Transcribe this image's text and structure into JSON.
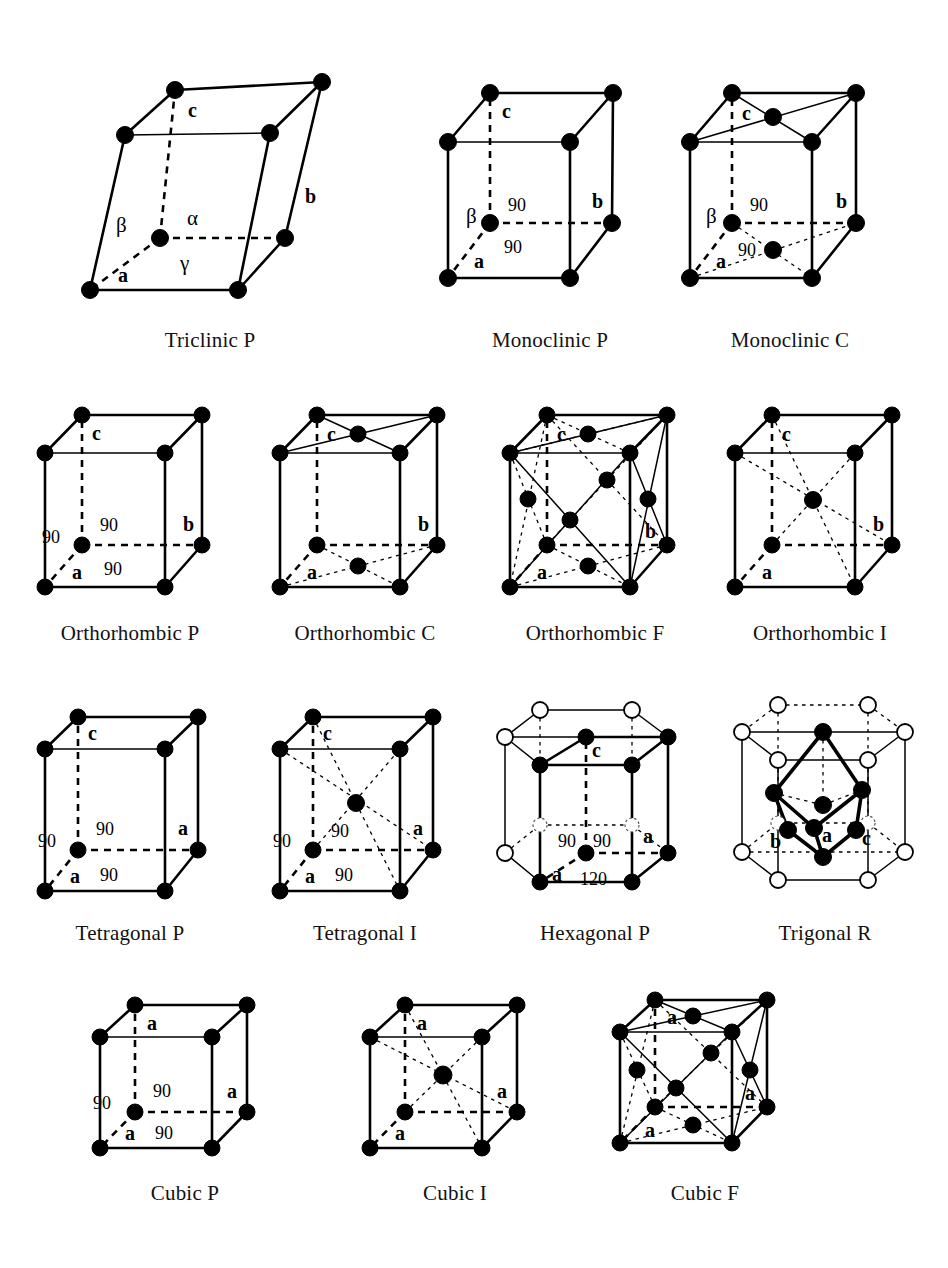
{
  "figure": {
    "background_color": "#ffffff",
    "ink_color": "#000000",
    "node_filled_color": "#000000",
    "node_open_color": "#ffffff"
  },
  "rows": [
    {
      "index": 0,
      "cells": [
        "triclinic_p",
        "monoclinic_p",
        "monoclinic_c"
      ]
    },
    {
      "index": 1,
      "cells": [
        "orthorhombic_p",
        "orthorhombic_c",
        "orthorhombic_f",
        "orthorhombic_i"
      ]
    },
    {
      "index": 2,
      "cells": [
        "tetragonal_p",
        "tetragonal_i",
        "hexagonal_p",
        "trigonal_r"
      ]
    },
    {
      "index": 3,
      "cells": [
        "cubic_p",
        "cubic_i",
        "cubic_f"
      ]
    }
  ],
  "lattices": {
    "triclinic_p": {
      "caption": "Triclinic P",
      "system": "triclinic",
      "centering": "P",
      "lattice_points": 8,
      "interior_points": 0,
      "face_points": 0,
      "axis_labels": [
        "a",
        "b",
        "c"
      ],
      "angle_labels": [
        "α",
        "β",
        "γ"
      ],
      "angle_values": []
    },
    "monoclinic_p": {
      "caption": "Monoclinic P",
      "system": "monoclinic",
      "centering": "P",
      "lattice_points": 8,
      "interior_points": 0,
      "face_points": 0,
      "axis_labels": [
        "a",
        "b",
        "c"
      ],
      "angle_labels": [
        "β"
      ],
      "angle_values": [
        "90",
        "90"
      ]
    },
    "monoclinic_c": {
      "caption": "Monoclinic C",
      "system": "monoclinic",
      "centering": "C",
      "lattice_points": 8,
      "interior_points": 0,
      "face_points": 2,
      "axis_labels": [
        "a",
        "b",
        "c"
      ],
      "angle_labels": [
        "β"
      ],
      "angle_values": [
        "90",
        "90"
      ]
    },
    "orthorhombic_p": {
      "caption": "Orthorhombic P",
      "system": "orthorhombic",
      "centering": "P",
      "lattice_points": 8,
      "interior_points": 0,
      "face_points": 0,
      "axis_labels": [
        "a",
        "b",
        "c"
      ],
      "angle_labels": [],
      "angle_values": [
        "90",
        "90",
        "90"
      ]
    },
    "orthorhombic_c": {
      "caption": "Orthorhombic C",
      "system": "orthorhombic",
      "centering": "C",
      "lattice_points": 8,
      "interior_points": 0,
      "face_points": 2,
      "axis_labels": [
        "a",
        "b",
        "c"
      ],
      "angle_labels": [],
      "angle_values": []
    },
    "orthorhombic_f": {
      "caption": "Orthorhombic F",
      "system": "orthorhombic",
      "centering": "F",
      "lattice_points": 8,
      "interior_points": 0,
      "face_points": 6,
      "axis_labels": [
        "a",
        "b",
        "c"
      ],
      "angle_labels": [],
      "angle_values": []
    },
    "orthorhombic_i": {
      "caption": "Orthorhombic I",
      "system": "orthorhombic",
      "centering": "I",
      "lattice_points": 8,
      "interior_points": 1,
      "face_points": 0,
      "axis_labels": [
        "a",
        "b",
        "c"
      ],
      "angle_labels": [],
      "angle_values": []
    },
    "tetragonal_p": {
      "caption": "Tetragonal P",
      "system": "tetragonal",
      "centering": "P",
      "lattice_points": 8,
      "interior_points": 0,
      "face_points": 0,
      "axis_labels": [
        "a",
        "a",
        "c"
      ],
      "angle_labels": [],
      "angle_values": [
        "90",
        "90",
        "90"
      ]
    },
    "tetragonal_i": {
      "caption": "Tetragonal I",
      "system": "tetragonal",
      "centering": "I",
      "lattice_points": 8,
      "interior_points": 1,
      "face_points": 0,
      "axis_labels": [
        "a",
        "a",
        "c"
      ],
      "angle_labels": [],
      "angle_values": [
        "90",
        "90",
        "90"
      ]
    },
    "hexagonal_p": {
      "caption": "Hexagonal P",
      "system": "hexagonal",
      "centering": "P",
      "lattice_points": 8,
      "interior_points": 0,
      "face_points": 0,
      "axis_labels": [
        "a",
        "a",
        "c"
      ],
      "angle_labels": [],
      "angle_values": [
        "90",
        "90",
        "120"
      ]
    },
    "trigonal_r": {
      "caption": "Trigonal R",
      "system": "trigonal",
      "centering": "R",
      "lattice_points": 8,
      "interior_points": 0,
      "face_points": 0,
      "axis_labels": [
        "a",
        "b",
        "c"
      ],
      "angle_labels": [],
      "angle_values": []
    },
    "cubic_p": {
      "caption": "Cubic P",
      "system": "cubic",
      "centering": "P",
      "lattice_points": 8,
      "interior_points": 0,
      "face_points": 0,
      "axis_labels": [
        "a",
        "a",
        "a"
      ],
      "angle_labels": [],
      "angle_values": [
        "90",
        "90",
        "90"
      ]
    },
    "cubic_i": {
      "caption": "Cubic I",
      "system": "cubic",
      "centering": "I",
      "lattice_points": 8,
      "interior_points": 1,
      "face_points": 0,
      "axis_labels": [
        "a",
        "a",
        "a"
      ],
      "angle_labels": [],
      "angle_values": []
    },
    "cubic_f": {
      "caption": "Cubic F",
      "system": "cubic",
      "centering": "F",
      "lattice_points": 8,
      "interior_points": 0,
      "face_points": 6,
      "axis_labels": [
        "a",
        "a",
        "a"
      ],
      "angle_labels": [],
      "angle_values": []
    }
  },
  "text": {
    "alpha": "α",
    "beta": "β",
    "gamma": "γ",
    "a": "a",
    "b": "b",
    "c": "c",
    "ninety": "90",
    "one_twenty": "120"
  }
}
